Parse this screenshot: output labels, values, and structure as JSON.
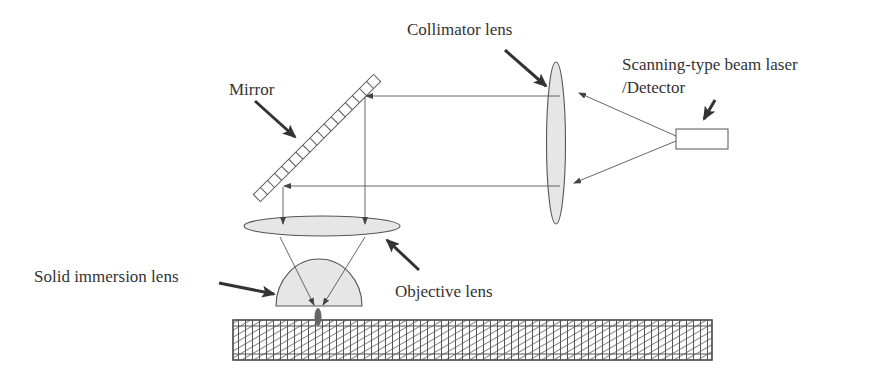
{
  "figure": {
    "type": "optical-system-schematic",
    "colors": {
      "background": "#ffffff",
      "line": "#555555",
      "lens_fill": "#e6e6e6",
      "arrow": "#333333",
      "text": "#333333",
      "hatch": "#666666"
    }
  },
  "labels": {
    "mirror": "Mirror",
    "collimator_lens": "Collimator lens",
    "laser_detector_line1": "Scanning-type beam laser",
    "laser_detector_line2": "/Detector",
    "objective_lens": "Objective lens",
    "solid_immersion_lens": "Solid immersion lens"
  },
  "components": [
    {
      "id": "laser-detector",
      "shape": "rectangle",
      "label_key": "laser_detector"
    },
    {
      "id": "collimator-lens",
      "shape": "ellipse",
      "label_key": "collimator_lens"
    },
    {
      "id": "mirror",
      "shape": "segmented-bar",
      "segments": 17,
      "label_key": "mirror"
    },
    {
      "id": "objective-lens",
      "shape": "ellipse",
      "label_key": "objective_lens"
    },
    {
      "id": "solid-immersion-lens",
      "shape": "hemisphere",
      "label_key": "solid_immersion_lens"
    },
    {
      "id": "sample-substrate",
      "shape": "hatched-rectangle"
    }
  ]
}
